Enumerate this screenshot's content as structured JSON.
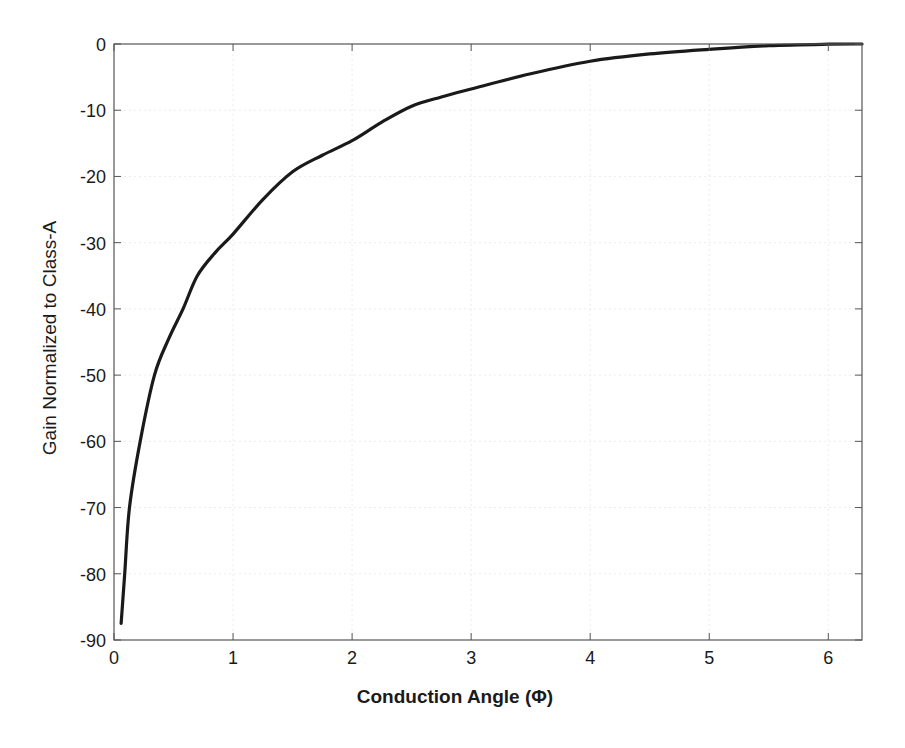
{
  "chart_data": {
    "type": "line",
    "title": "",
    "xlabel": "Conduction Angle (Φ)",
    "ylabel": "Gain Normalized to Class-A",
    "xlim": [
      0,
      6.2832
    ],
    "ylim": [
      -90,
      0
    ],
    "xticks": [
      0,
      1,
      2,
      3,
      4,
      5,
      6
    ],
    "xtick_labels": [
      "0",
      "1",
      "2",
      "3",
      "4",
      "5",
      "6"
    ],
    "yticks": [
      0,
      -10,
      -20,
      -30,
      -40,
      -50,
      -60,
      -70,
      -80,
      -90
    ],
    "ytick_labels": [
      "0",
      "-10",
      "-20",
      "-30",
      "-40",
      "-50",
      "-60",
      "-70",
      "-80",
      "-90"
    ],
    "grid": true,
    "legend": "none",
    "series": [
      {
        "name": "Gain",
        "color": "#1a1a1a",
        "x": [
          0.06,
          0.09,
          0.13,
          0.22,
          0.34,
          0.46,
          0.58,
          0.7,
          0.85,
          1.0,
          1.25,
          1.5,
          1.75,
          2.0,
          2.25,
          2.5,
          2.75,
          3.0,
          3.5,
          4.0,
          4.5,
          5.0,
          5.5,
          6.0,
          6.2832
        ],
        "y": [
          -87.5,
          -80,
          -70,
          -60,
          -50,
          -44.5,
          -40,
          -35,
          -31.5,
          -28.7,
          -23.5,
          -19.3,
          -16.8,
          -14.6,
          -11.8,
          -9.4,
          -8.0,
          -6.8,
          -4.5,
          -2.6,
          -1.5,
          -0.8,
          -0.25,
          -0.03,
          0
        ]
      }
    ]
  }
}
